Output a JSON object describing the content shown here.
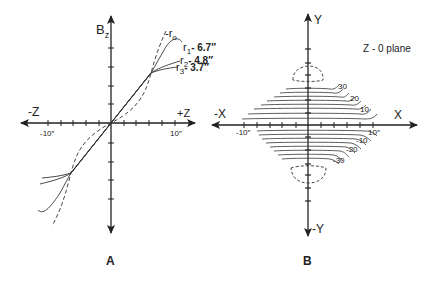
{
  "figure": {
    "panel_a": {
      "caption": "A",
      "y_axis_label": "B",
      "y_axis_subscript": "z",
      "x_neg_label": "-Z",
      "x_pos_label": "+Z",
      "tick_neg_label": "-10″",
      "tick_pos_label": "10″",
      "curves": [
        {
          "name": "r0",
          "label_prefix": "-r",
          "label_sub": "o",
          "style": "dashed"
        },
        {
          "name": "r1",
          "label_prefix": "r",
          "label_sub": "1",
          "label_value": "- 6.7″",
          "style": "solid"
        },
        {
          "name": "r2",
          "label_prefix": "r",
          "label_sub": "2",
          "label_value": "- 4.8″",
          "style": "solid"
        },
        {
          "name": "r3",
          "label_prefix": "r",
          "label_sub": "3",
          "label_value": "- 3.7″",
          "style": "solid"
        }
      ]
    },
    "panel_b": {
      "caption": "B",
      "y_pos_label": "Y",
      "y_neg_label": "-Y",
      "x_neg_label": "-X",
      "x_pos_label": "X",
      "tick_neg_label": "-10″",
      "tick_pos_label": "10″",
      "plane_label": "Z - 0 plane",
      "contours_upper": [
        "30",
        "20",
        "10"
      ],
      "contours_lower": [
        "-10",
        "-20",
        "-30"
      ]
    }
  },
  "colors": {
    "ink": "#222222",
    "background": "#ffffff"
  }
}
